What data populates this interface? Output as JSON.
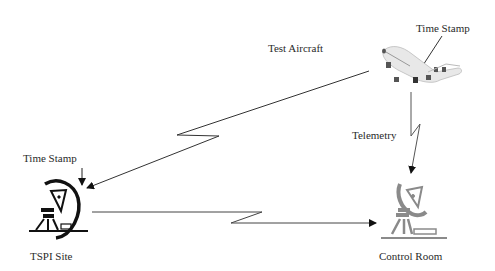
{
  "diagram": {
    "nodes": {
      "aircraft": {
        "label": "Test Aircraft",
        "annotation": "Time Stamp",
        "icon": "airplane-icon"
      },
      "tspi_site": {
        "label": "TSPI Site",
        "annotation": "Time Stamp",
        "icon": "satellite-dish-icon"
      },
      "control_room": {
        "label": "Control Room",
        "icon": "satellite-dish-icon"
      }
    },
    "links": [
      {
        "from": "aircraft",
        "to": "tspi_site",
        "style": "wireless-zigzag-arrow"
      },
      {
        "from": "aircraft",
        "to": "control_room",
        "label": "Telemetry",
        "style": "wireless-zigzag-arrow"
      },
      {
        "from": "tspi_site",
        "to": "control_room",
        "style": "wireless-zigzag-arrow"
      }
    ],
    "colors": {
      "line": "#333333",
      "tspi_icon": "#111111",
      "control_icon": "#8a8a8a",
      "aircraft_body": "#e6e6e6"
    }
  }
}
